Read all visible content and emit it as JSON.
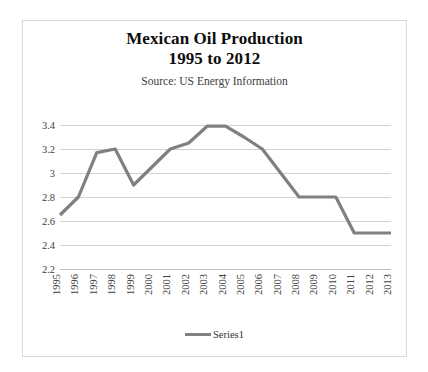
{
  "figure": {
    "border_color": "#d9d9d9",
    "background": "#ffffff"
  },
  "title": {
    "line1": "Mexican Oil Production",
    "line2": "1995 to 2012",
    "subtitle": "Source: US Energy Information"
  },
  "legend": {
    "label": "Series1",
    "position": "bottom",
    "swatch_color": "#808080"
  },
  "chart_data": {
    "type": "line",
    "title": "Mexican Oil Production 1995 to 2012",
    "subtitle": "Source: US Energy Information",
    "xlabel": "",
    "ylabel": "",
    "grid": true,
    "legend_position": "bottom",
    "line_color": "#808080",
    "x": [
      "1995",
      "1996",
      "1997",
      "1998",
      "1999",
      "2000",
      "2001",
      "2002",
      "2003",
      "2004",
      "2005",
      "2006",
      "2007",
      "2008",
      "2009",
      "2010",
      "2011",
      "2012",
      "2013"
    ],
    "categories": [
      "1995",
      "1996",
      "1997",
      "1998",
      "1999",
      "2000",
      "2001",
      "2002",
      "2003",
      "2004",
      "2005",
      "2006",
      "2007",
      "2008",
      "2009",
      "2010",
      "2011",
      "2012",
      "2013"
    ],
    "series": [
      {
        "name": "Series1",
        "values": [
          2.65,
          2.8,
          3.17,
          3.2,
          2.9,
          3.05,
          3.2,
          3.25,
          3.39,
          3.39,
          3.3,
          3.2,
          3.0,
          2.8,
          2.8,
          2.8,
          2.5,
          2.5,
          2.5
        ]
      }
    ],
    "values": [
      2.65,
      2.8,
      3.17,
      3.2,
      2.9,
      3.05,
      3.2,
      3.25,
      3.39,
      3.39,
      3.3,
      3.2,
      3.0,
      2.8,
      2.8,
      2.8,
      2.5,
      2.5,
      2.5
    ],
    "ylim": [
      2.2,
      3.4
    ],
    "yticks": [
      3.4,
      3.2,
      3,
      2.8,
      2.6,
      2.4,
      2.2
    ],
    "ytick_labels": [
      "3.4",
      "3.2",
      "3",
      "2.8",
      "2.6",
      "2.4",
      "2.2"
    ],
    "xtick_labels": [
      "1995",
      "1996",
      "1997",
      "1998",
      "1999",
      "2000",
      "2001",
      "2002",
      "2003",
      "2004",
      "2005",
      "2006",
      "2007",
      "2008",
      "2009",
      "2010",
      "2011",
      "2012",
      "2013"
    ],
    "xtick_rotation": 90
  }
}
